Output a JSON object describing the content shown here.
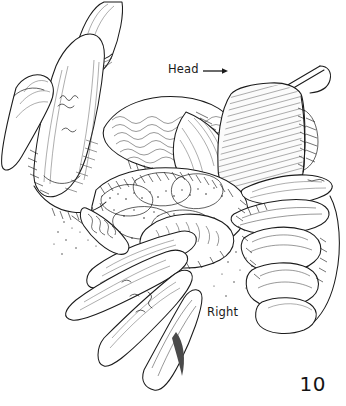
{
  "figure": {
    "number": "10",
    "kind": "surgical-line-illustration",
    "background_color": "#ffffff",
    "ink_color": "#1b1b1b",
    "width": 346,
    "height": 406
  },
  "labels": {
    "head": "Head",
    "head_arrow_direction": "right",
    "right": "Right"
  },
  "scene": {
    "description": "Pen-and-ink surgical illustration of an open operative field held by two gloved hands with a malleable retractor blade exposing layered tissue",
    "elements": [
      {
        "name": "upper-left-hand",
        "label": "Surgeon left hand with index and middle fingers pressing tissue"
      },
      {
        "name": "retractor-blade",
        "label": "Malleable retractor blade with handle"
      },
      {
        "name": "exposed-tissue",
        "label": "Exposed abdominal contents and fascial layers"
      },
      {
        "name": "lower-left-fingers",
        "label": "Extended fingers retracting from lower left"
      },
      {
        "name": "right-hand",
        "label": "Assistant right hand with curled fingers"
      }
    ]
  }
}
